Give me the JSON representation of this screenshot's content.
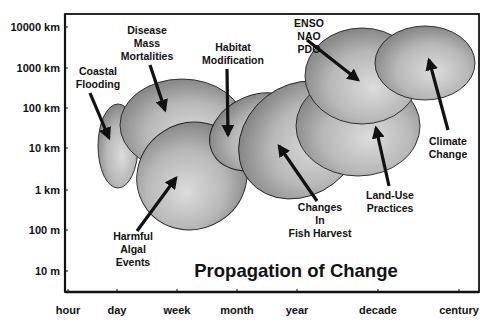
{
  "title": "Propagation of Change",
  "colors": {
    "frame": "#111111",
    "ellipse_light": "#d9d9d9",
    "ellipse_mid": "#b3b3b3",
    "ellipse_dark": "#7a7a7a",
    "outline": "#222222",
    "text": "#111111",
    "background": "#ffffff"
  },
  "axes": {
    "frame": {
      "left": 65,
      "top": 14,
      "right": 479,
      "bottom": 292
    },
    "x": {
      "label": "",
      "ticks": [
        {
          "label": "hour",
          "x": 68
        },
        {
          "label": "day",
          "x": 117
        },
        {
          "label": "week",
          "x": 177
        },
        {
          "label": "month",
          "x": 237
        },
        {
          "label": "year",
          "x": 297
        },
        {
          "label": "decade",
          "x": 378
        },
        {
          "label": "century",
          "x": 459
        }
      ]
    },
    "y": {
      "label": "",
      "ticks": [
        {
          "label": "10000 km",
          "y": 27
        },
        {
          "label": "1000 km",
          "y": 68
        },
        {
          "label": "100 km",
          "y": 108
        },
        {
          "label": "10 km",
          "y": 148
        },
        {
          "label": "1 km",
          "y": 190
        },
        {
          "label": "100 m",
          "y": 230
        },
        {
          "label": "10 m",
          "y": 271
        }
      ]
    }
  },
  "chart_data": {
    "type": "diagram",
    "title": "Propagation of Change",
    "xlabel": "time scale",
    "ylabel": "spatial scale",
    "x_ticks": [
      "hour",
      "day",
      "week",
      "month",
      "year",
      "decade",
      "century"
    ],
    "y_ticks": [
      "10000 km",
      "1000 km",
      "100 km",
      "10 km",
      "1 km",
      "100 m",
      "10 m"
    ],
    "regions": [
      {
        "name": "Coastal Flooding",
        "time_range": [
          "~day",
          "~few days"
        ],
        "space_range": [
          "~1 km",
          "~100 km"
        ]
      },
      {
        "name": "Disease Mass Mortalities",
        "time_range": [
          "~day",
          "~month"
        ],
        "space_range": [
          "~10 km",
          "~1000 km"
        ]
      },
      {
        "name": "Harmful Algal Events",
        "time_range": [
          "~few days",
          "~month"
        ],
        "space_range": [
          "~100 m",
          "~100 km"
        ]
      },
      {
        "name": "Habitat Modification",
        "time_range": [
          "~month",
          "~year"
        ],
        "space_range": [
          "~1 km",
          "~100 km"
        ]
      },
      {
        "name": "Changes In Fish Harvest",
        "time_range": [
          "~month",
          "~decade"
        ],
        "space_range": [
          "~1 km",
          "~1000 km"
        ]
      },
      {
        "name": "Land-Use Practices",
        "time_range": [
          "~year",
          "~decades"
        ],
        "space_range": [
          "~10 km",
          "~1000 km"
        ]
      },
      {
        "name": "ENSO NAO PDO",
        "time_range": [
          "~year",
          "~decades"
        ],
        "space_range": [
          "~100 km",
          "~10000 km"
        ]
      },
      {
        "name": "Climate Change",
        "time_range": [
          "~decade",
          "~century"
        ],
        "space_range": [
          "~100 km",
          "~10000 km"
        ]
      }
    ]
  },
  "ellipses": [
    {
      "id": "coastal-flooding",
      "cx": 118,
      "cy": 146,
      "rx": 20,
      "ry": 42,
      "rot": 0
    },
    {
      "id": "disease-mass-mortalities",
      "cx": 182,
      "cy": 125,
      "rx": 62,
      "ry": 46,
      "rot": 0
    },
    {
      "id": "harmful-algal-events",
      "cx": 192,
      "cy": 176,
      "rx": 53,
      "ry": 56,
      "rot": 58
    },
    {
      "id": "habitat-modification",
      "cx": 258,
      "cy": 132,
      "rx": 50,
      "ry": 37,
      "rot": -22
    },
    {
      "id": "changes-in-fish-harvest",
      "cx": 300,
      "cy": 140,
      "rx": 65,
      "ry": 55,
      "rot": -38
    },
    {
      "id": "land-use-practices",
      "cx": 358,
      "cy": 126,
      "rx": 62,
      "ry": 50,
      "rot": 0
    },
    {
      "id": "enso-nao-pdo",
      "cx": 362,
      "cy": 76,
      "rx": 57,
      "ry": 48,
      "rot": 0
    },
    {
      "id": "climate-change",
      "cx": 425,
      "cy": 63,
      "rx": 50,
      "ry": 37,
      "rot": 0
    }
  ],
  "annotations": [
    {
      "id": "coastal-flooding",
      "lines": [
        "Coastal",
        "Flooding"
      ],
      "x": 98,
      "y": 75,
      "arrow": {
        "x1": 90,
        "y1": 93,
        "x2": 109,
        "y2": 138
      }
    },
    {
      "id": "disease-mass-mortalities",
      "lines": [
        "Disease",
        "Mass",
        "Mortalities"
      ],
      "x": 147,
      "y": 34,
      "arrow": {
        "x1": 150,
        "y1": 65,
        "x2": 165,
        "y2": 110
      }
    },
    {
      "id": "habitat-modification",
      "lines": [
        "Habitat",
        "Modification"
      ],
      "x": 233,
      "y": 51,
      "arrow": {
        "x1": 227,
        "y1": 69,
        "x2": 228,
        "y2": 135
      }
    },
    {
      "id": "enso-nao-pdo",
      "lines": [
        "ENSO",
        "NAO",
        "PDO"
      ],
      "x": 309,
      "y": 27,
      "arrow": {
        "x1": 307,
        "y1": 40,
        "x2": 358,
        "y2": 80
      }
    },
    {
      "id": "climate-change",
      "lines": [
        "Climate",
        "Change"
      ],
      "x": 448,
      "y": 145,
      "arrow": {
        "x1": 448,
        "y1": 130,
        "x2": 429,
        "y2": 60
      }
    },
    {
      "id": "land-use-practices",
      "lines": [
        "Land-Use",
        "Practices"
      ],
      "x": 390,
      "y": 199,
      "arrow": {
        "x1": 389,
        "y1": 186,
        "x2": 376,
        "y2": 128
      }
    },
    {
      "id": "changes-in-fish-harvest",
      "lines": [
        "Changes",
        "In",
        "Fish Harvest"
      ],
      "x": 320,
      "y": 211,
      "arrow": {
        "x1": 317,
        "y1": 201,
        "x2": 279,
        "y2": 146
      }
    },
    {
      "id": "harmful-algal-events",
      "lines": [
        "Harmful",
        "Algal",
        "Events"
      ],
      "x": 133,
      "y": 240,
      "arrow": {
        "x1": 137,
        "y1": 231,
        "x2": 176,
        "y2": 178
      }
    }
  ]
}
